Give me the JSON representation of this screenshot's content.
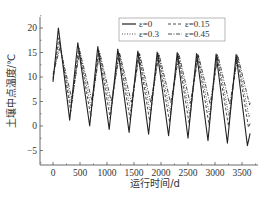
{
  "chart_data": {
    "type": "line",
    "title": "",
    "xlabel": "运行时间/d",
    "ylabel": "土壤中点温度/℃",
    "xlim": [
      -250,
      3800
    ],
    "ylim": [
      -7.5,
      22.5
    ],
    "xticks": [
      0,
      500,
      1000,
      1500,
      2000,
      2500,
      3000,
      3500
    ],
    "yticks": [
      -5,
      0,
      5,
      10,
      15,
      20
    ],
    "grid": false,
    "legend_position": "upper right",
    "series": [
      {
        "name": "ε=0",
        "style": "solid",
        "x": [
          0,
          100,
          310,
          460,
          680,
          830,
          1040,
          1200,
          1410,
          1570,
          1770,
          1930,
          2140,
          2300,
          2500,
          2660,
          2870,
          3020,
          3230,
          3390,
          3600,
          3650
        ],
        "y": [
          9,
          20,
          1.2,
          17,
          0,
          16.2,
          -0.7,
          15.7,
          -1.3,
          15.3,
          -1.7,
          15.1,
          -2,
          15,
          -2.5,
          14.8,
          -3,
          14.7,
          -3.5,
          14.6,
          -4,
          -1.5
        ]
      },
      {
        "name": "ε=0.15",
        "style": "dashed",
        "x": [
          0,
          110,
          330,
          475,
          700,
          845,
          1060,
          1215,
          1430,
          1585,
          1790,
          1945,
          2160,
          2315,
          2520,
          2675,
          2890,
          3035,
          3250,
          3405,
          3620,
          3650
        ],
        "y": [
          9.5,
          18,
          3,
          16,
          2,
          15.5,
          1.6,
          15.2,
          1.3,
          15,
          1,
          14.9,
          0.8,
          14.8,
          0.5,
          14.7,
          0.2,
          14.6,
          0,
          14.5,
          -0.3,
          0.5
        ]
      },
      {
        "name": "ε=0.3",
        "style": "dotted",
        "x": [
          0,
          120,
          340,
          485,
          710,
          855,
          1070,
          1225,
          1440,
          1595,
          1800,
          1955,
          2170,
          2325,
          2530,
          2685,
          2900,
          3045,
          3260,
          3415,
          3630,
          3650
        ],
        "y": [
          10,
          17,
          4,
          15.8,
          3.5,
          15.3,
          3.2,
          15,
          3,
          14.9,
          2.8,
          14.8,
          2.6,
          14.7,
          2.4,
          14.6,
          2.2,
          14.5,
          2,
          14.4,
          1.8,
          2.5
        ]
      },
      {
        "name": "ε=0.45",
        "style": "dashdot",
        "x": [
          0,
          130,
          350,
          495,
          720,
          865,
          1080,
          1235,
          1450,
          1605,
          1810,
          1965,
          2180,
          2335,
          2540,
          2695,
          2910,
          3055,
          3270,
          3425,
          3640,
          3650
        ],
        "y": [
          10.5,
          16,
          5.5,
          15.3,
          5.2,
          15,
          5,
          14.8,
          4.9,
          14.7,
          4.8,
          14.6,
          4.7,
          14.5,
          4.6,
          14.4,
          4.5,
          14.3,
          4.4,
          14.2,
          4.3,
          4.8
        ]
      }
    ]
  },
  "legend": {
    "items": [
      {
        "label": "ε=0",
        "dash": ""
      },
      {
        "label": "ε=0.15",
        "dash": "3,2"
      },
      {
        "label": "ε=0.3",
        "dash": "1,1.5"
      },
      {
        "label": "ε=0.45",
        "dash": "4,1.5,1,1.5"
      }
    ]
  },
  "axes": {
    "xlabel": "运行时间/d",
    "ylabel": "土壤中点温度/℃"
  }
}
